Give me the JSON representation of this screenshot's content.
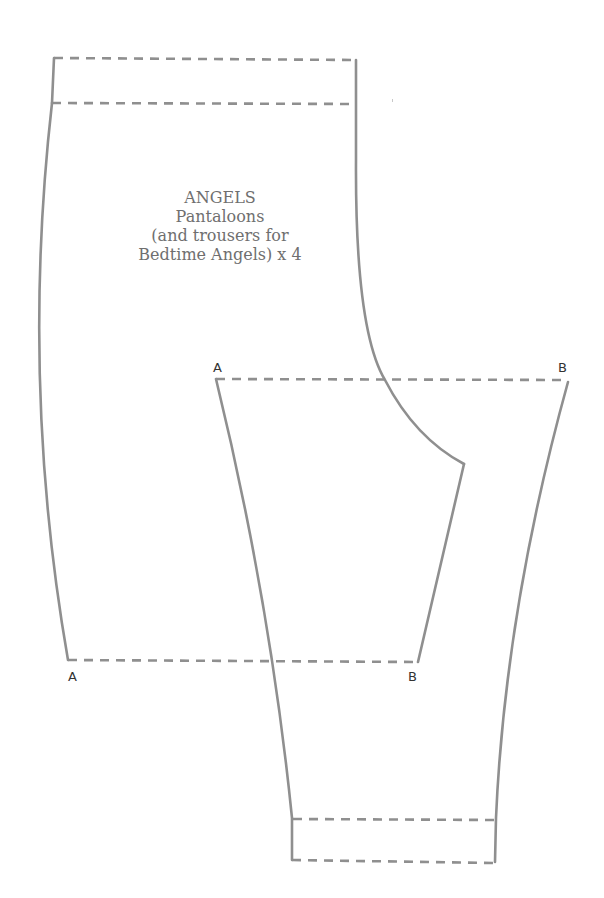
{
  "pattern": {
    "title": "ANGELS",
    "subtitle": "Pantaloons",
    "note_line_1": "(and trousers for",
    "note_line_2": "Bedtime Angels) x 4"
  },
  "markers": {
    "upper_left_A": "A",
    "upper_right_B": "B",
    "lower_left_A": "A",
    "lower_right_B": "B"
  },
  "style": {
    "line_color": "#8f8f8f",
    "text_color": "#6f6f6f",
    "marker_color": "#333333",
    "background": "#ffffff"
  }
}
